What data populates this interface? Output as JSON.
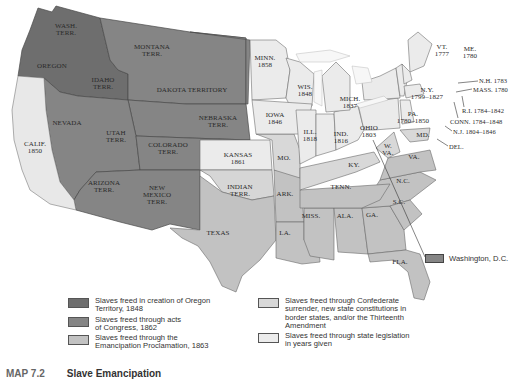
{
  "colors": {
    "oregon_1848": "#6e6e6e",
    "congress_1862": "#8a8a8a",
    "emancipation_1863": "#c4c4c4",
    "confederate_surrender": "#d9d9d9",
    "state_legislation": "#ececec",
    "border": "#555555"
  },
  "map": {
    "regions": [
      {
        "name": "WASH.",
        "line2": "TERR."
      },
      {
        "name": "OREGON"
      },
      {
        "name": "IDAHO",
        "line2": "TERR."
      },
      {
        "name": "MONTANA",
        "line2": "TERR."
      },
      {
        "name": "DAKOTA TERRITORY"
      },
      {
        "name": "NEBRASKA",
        "line2": "TERR."
      },
      {
        "name": "NEVADA"
      },
      {
        "name": "UTAH",
        "line2": "TERR."
      },
      {
        "name": "COLORADO",
        "line2": "TERR."
      },
      {
        "name": "ARIZONA",
        "line2": "TERR."
      },
      {
        "name": "NEW",
        "line2": "MEXICO",
        "line3": "TERR."
      },
      {
        "name": "CALIF.",
        "line2": "1850"
      },
      {
        "name": "KANSAS",
        "line2": "1861"
      },
      {
        "name": "INDIAN",
        "line2": "TERR."
      },
      {
        "name": "TEXAS"
      },
      {
        "name": "MINN.",
        "line2": "1858"
      },
      {
        "name": "WIS.",
        "line2": "1848"
      },
      {
        "name": "MICH.",
        "line2": "1837"
      },
      {
        "name": "IOWA",
        "line2": "1846"
      },
      {
        "name": "ILL.",
        "line2": "1818"
      },
      {
        "name": "IND.",
        "line2": "1816"
      },
      {
        "name": "OHIO",
        "line2": "1803"
      },
      {
        "name": "PA.",
        "line2": "1780–1850"
      },
      {
        "name": "N.Y.",
        "line2": "1799–1827"
      },
      {
        "name": "VT.",
        "line2": "1777"
      },
      {
        "name": "ME.",
        "line2": "1780"
      },
      {
        "name": "MO."
      },
      {
        "name": "KY."
      },
      {
        "name": "W.",
        "line2": "VA."
      },
      {
        "name": "VA."
      },
      {
        "name": "MD."
      },
      {
        "name": "N.C."
      },
      {
        "name": "TENN."
      },
      {
        "name": "ARK."
      },
      {
        "name": "S.C."
      },
      {
        "name": "MISS."
      },
      {
        "name": "ALA."
      },
      {
        "name": "GA."
      },
      {
        "name": "LA."
      },
      {
        "name": "FLA."
      }
    ],
    "callouts": [
      "N.H. 1783",
      "MASS. 1780",
      "R.I. 1784–1842",
      "CONN. 1784–1848",
      "N.J. 1804–1846",
      "DEL."
    ],
    "dc_legend": "Washington, D.C."
  },
  "legend": {
    "left": [
      {
        "label": "Slaves freed in creation of Oregon Territory, 1848",
        "l1": "Slaves freed in creation of Oregon",
        "l2": "Territory, 1848"
      },
      {
        "label": "Slaves freed through acts of Congress, 1862",
        "l1": "Slaves freed through acts",
        "l2": "of Congress, 1862"
      },
      {
        "label": "Slaves freed through the Emancipation Proclamation, 1863",
        "l1": "Slaves freed through the",
        "l2": "Emancipation Proclamation, 1863"
      }
    ],
    "right": [
      {
        "label": "Slaves freed through Confederate surrender, new state constitutions in border states, and/or the Thirteenth Amendment",
        "l1": "Slaves freed through Confederate",
        "l2": "surrender, new state constitutions in",
        "l3": "border states, and/or the Thirteenth",
        "l4": "Amendment"
      },
      {
        "label": "Slaves freed through state legislation in years given",
        "l1": "Slaves freed through state legislation",
        "l2": "in years given"
      }
    ]
  },
  "caption": {
    "number": "MAP 7.2",
    "title": "Slave Emancipation"
  }
}
